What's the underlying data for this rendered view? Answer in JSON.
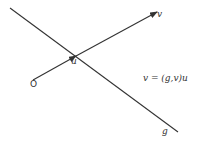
{
  "diagram": {
    "labels": {
      "origin": "O",
      "u": "u",
      "v": "v",
      "g": "g",
      "equation": "v = (g,v)u"
    },
    "colors": {
      "line": "#333333",
      "background": "#ffffff"
    },
    "elements": [
      {
        "type": "line",
        "name": "g",
        "from": [
          10,
          8
        ],
        "to": [
          178,
          132
        ]
      },
      {
        "type": "vector",
        "name": "u",
        "from": [
          33,
          80
        ],
        "to": [
          76,
          56
        ]
      },
      {
        "type": "vector",
        "name": "v",
        "from": [
          76,
          56
        ],
        "to": [
          157,
          12
        ]
      }
    ]
  }
}
